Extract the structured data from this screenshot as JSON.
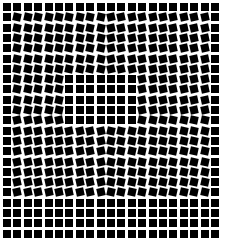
{
  "illusion": {
    "description": "Grid of black squares with tilted squares creating a bulge illusion",
    "background_color": "#ffffff",
    "square_color": "#000000",
    "cols": 21,
    "rows": 23,
    "origin_x": 3,
    "origin_y": 3,
    "pitch_x": 10.4,
    "pitch_y": 10.3,
    "square_size": 8,
    "upright_border": {
      "top_rows": 1,
      "bottom_rows": 4,
      "left_cols": 1,
      "right_cols": 1
    },
    "upright_inner": {
      "col_start": 6,
      "col_end": 12,
      "row_start": 7,
      "row_end": 11
    },
    "tilt_degrees": 12
  }
}
